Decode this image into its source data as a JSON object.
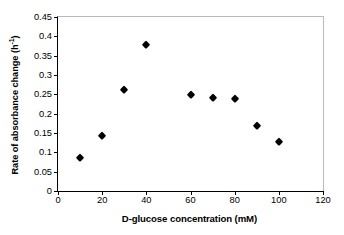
{
  "chart_data": {
    "type": "scatter",
    "title": "",
    "xlabel": "D-glucose concentration (mM)",
    "ylabel": "Rate of absorbance change (h",
    "ylabel_sup": "-1",
    "ylabel_suffix": ")",
    "ylabel_full": "Rate of absorbance change (h-1)",
    "x": [
      10,
      20,
      30,
      40,
      60,
      70,
      80,
      90,
      100
    ],
    "values": [
      0.086,
      0.142,
      0.261,
      0.378,
      0.248,
      0.24,
      0.238,
      0.168,
      0.127
    ],
    "series": [
      {
        "name": "Rate of absorbance change",
        "marker": "filled-diamond",
        "color": "#000000",
        "points": [
          {
            "x": 10,
            "y": 0.086
          },
          {
            "x": 20,
            "y": 0.142
          },
          {
            "x": 30,
            "y": 0.261
          },
          {
            "x": 40,
            "y": 0.378
          },
          {
            "x": 60,
            "y": 0.248
          },
          {
            "x": 70,
            "y": 0.24
          },
          {
            "x": 80,
            "y": 0.238
          },
          {
            "x": 90,
            "y": 0.168
          },
          {
            "x": 100,
            "y": 0.127
          }
        ]
      }
    ],
    "xlim": [
      0,
      120
    ],
    "ylim": [
      0,
      0.45
    ],
    "xticks": [
      0,
      20,
      40,
      60,
      80,
      100,
      120
    ],
    "xtick_labels": [
      "0",
      "20",
      "40",
      "60",
      "80",
      "100",
      "120"
    ],
    "yticks": [
      0,
      0.05,
      0.1,
      0.15,
      0.2,
      0.25,
      0.3,
      0.35,
      0.4,
      0.45
    ],
    "ytick_labels": [
      "0",
      "0.05",
      "0.1",
      "0.15",
      "0.2",
      "0.25",
      "0.3",
      "0.35",
      "0.4",
      "0.45"
    ],
    "grid": false,
    "legend": false,
    "frame_color": "#b9b9b9",
    "axis_color": "#000000"
  }
}
